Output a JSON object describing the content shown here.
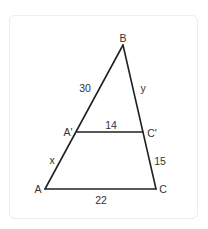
{
  "diagram": {
    "type": "similar-triangles",
    "colors": {
      "stroke": "#222222",
      "text": "#333333",
      "card_border": "#ececec",
      "background": "#ffffff"
    },
    "vertices": {
      "B": {
        "label": "B",
        "x": 123,
        "y": 45
      },
      "A": {
        "label": "A",
        "x": 45,
        "y": 189
      },
      "C": {
        "label": "C",
        "x": 156,
        "y": 189
      },
      "A_prime": {
        "label": "A'",
        "x": 77,
        "y": 132
      },
      "C_prime": {
        "label": "C'",
        "x": 143,
        "y": 132
      }
    },
    "segment_labels": {
      "BA_prime": "30",
      "BC_prime": "y",
      "A_primeC_prime": "14",
      "A_primeA": "x",
      "C_primeC": "15",
      "AC": "22"
    }
  }
}
